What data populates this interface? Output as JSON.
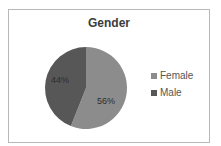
{
  "chart_data": {
    "type": "pie",
    "title": "Gender",
    "categories": [
      "Female",
      "Male"
    ],
    "values": [
      56,
      44
    ],
    "labels": [
      "56%",
      "44%"
    ],
    "colors": [
      "#8c8c8c",
      "#575757"
    ],
    "legend_position": "right"
  },
  "legend": {
    "items": [
      {
        "label": "Female",
        "color": "#8c8c8c"
      },
      {
        "label": "Male",
        "color": "#575757"
      }
    ]
  }
}
